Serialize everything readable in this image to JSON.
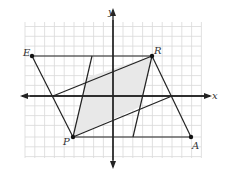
{
  "diagram": {
    "type": "coordinate-plane-geometry",
    "axes": {
      "x_label": "x",
      "y_label": "y"
    },
    "points": [
      {
        "name": "E",
        "label": "E"
      },
      {
        "name": "R",
        "label": "R"
      },
      {
        "name": "A",
        "label": "A"
      },
      {
        "name": "P",
        "label": "P"
      }
    ],
    "shapes": {
      "outer_parallelogram": "ERAP",
      "shaded_region": "inner parallelogram formed by lines from P and R"
    },
    "colors": {
      "grid": "#d9d9d9",
      "lines": "#222222",
      "shade": "#e6e6e6",
      "labels": "#333333"
    }
  }
}
